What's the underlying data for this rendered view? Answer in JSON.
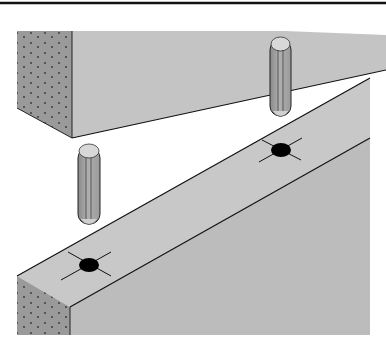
{
  "figure": {
    "colors": {
      "background": "#ffffff",
      "face_light": "#c4c4c4",
      "face_side": "#b8b8b8",
      "end_grain": "#9a9a9a",
      "outline": "#1a1a1a",
      "hole": "#000000",
      "dowel_body": "#a8a8a8",
      "dowel_cap": "#d8d8d8"
    },
    "parts": [
      {
        "name": "upper-block",
        "label": "Upper wooden block"
      },
      {
        "name": "lower-bar",
        "label": "Lower wooden bar"
      },
      {
        "name": "dowel-left",
        "label": "Dowel pin"
      },
      {
        "name": "dowel-right",
        "label": "Dowel pin"
      },
      {
        "name": "hole-left",
        "label": "Dowel hole marked with crosshair"
      },
      {
        "name": "hole-right",
        "label": "Dowel hole marked with crosshair"
      }
    ]
  }
}
